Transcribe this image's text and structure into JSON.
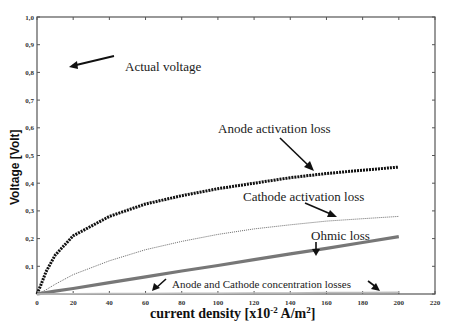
{
  "chart_data": {
    "type": "line",
    "title": "",
    "xlabel": "current density [x10^-2 A/m^2]",
    "xlabel_parts": {
      "main": "current density [x10",
      "sup1": "-2",
      "mid": " A/m",
      "sup2": "2",
      "end": "]"
    },
    "ylabel": "Voltage [Volt]",
    "xlim": [
      0,
      220
    ],
    "ylim": [
      0,
      1.0
    ],
    "x_ticks": [
      0,
      20,
      40,
      60,
      80,
      100,
      120,
      140,
      160,
      180,
      200,
      220
    ],
    "y_ticks": [
      "",
      "0,1",
      "0,2",
      "0,3",
      "0,4",
      "0,5",
      "0,6",
      "0,7",
      "0,8",
      "0,9",
      "1,0"
    ],
    "grid": false,
    "legend": "none (inline annotations)",
    "x": [
      0,
      2,
      5,
      10,
      20,
      40,
      60,
      80,
      100,
      120,
      140,
      160,
      180,
      200
    ],
    "series": [
      {
        "name": "Anode activation loss",
        "style": "thick-dotted",
        "values": [
          0.0,
          0.03,
          0.08,
          0.14,
          0.21,
          0.28,
          0.325,
          0.355,
          0.38,
          0.4,
          0.42,
          0.435,
          0.447,
          0.458
        ]
      },
      {
        "name": "Cathode activation loss",
        "style": "thin-dotted",
        "values": [
          0.0,
          0.005,
          0.015,
          0.035,
          0.07,
          0.12,
          0.16,
          0.19,
          0.215,
          0.235,
          0.25,
          0.263,
          0.272,
          0.28
        ]
      },
      {
        "name": "Ohmic loss",
        "style": "thick-gray",
        "values": [
          0.0,
          0.002,
          0.005,
          0.01,
          0.02,
          0.041,
          0.062,
          0.083,
          0.103,
          0.124,
          0.145,
          0.165,
          0.186,
          0.207
        ]
      },
      {
        "name": "Anode and Cathode concentration losses",
        "style": "thin-gray",
        "values": [
          0.0,
          0.0,
          0.0,
          0.0,
          0.001,
          0.002,
          0.002,
          0.003,
          0.003,
          0.004,
          0.004,
          0.005,
          0.005,
          0.006
        ]
      }
    ],
    "annotations": [
      {
        "text": "Actual voltage",
        "x": 125,
        "y": 67
      },
      {
        "text": "Anode activation loss",
        "x": 218,
        "y": 129
      },
      {
        "text": "Cathode activation loss",
        "x": 243,
        "y": 197
      },
      {
        "text": "Ohmic loss",
        "x": 311,
        "y": 237
      },
      {
        "text": "Anode and Cathode concentration losses",
        "x": 172,
        "y": 285
      }
    ]
  }
}
